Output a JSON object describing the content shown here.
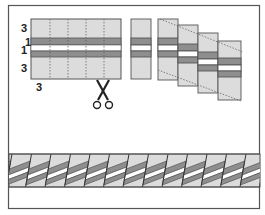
{
  "diagram": {
    "colors": {
      "frame": "#555555",
      "light_fabric": "#dcdcdc",
      "dark_fabric": "#8e8e8e",
      "white_fabric": "#ffffff",
      "outline": "#555555",
      "cut_line": "#666666"
    },
    "labels": {
      "top_strip_width": "3",
      "narrow_strip_1": "1",
      "narrow_strip_2": "1",
      "bottom_strip_width": "3",
      "segment_width": "3"
    },
    "steps": [
      {
        "name": "strip-set",
        "description": "Strip set with dotted cutting lines"
      },
      {
        "name": "cut-segments",
        "description": "Cut segments offset in a staircase"
      },
      {
        "name": "finished-band",
        "description": "Segments joined into diagonal band"
      }
    ],
    "icons": [
      "scissors-icon"
    ]
  }
}
